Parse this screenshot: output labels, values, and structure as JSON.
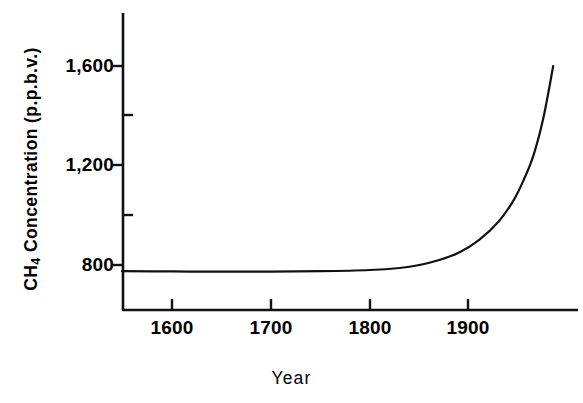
{
  "chart_data": {
    "type": "line",
    "title": "",
    "xlabel": "Year",
    "ylabel": "CH4 Concentration (p.p.b.v.)",
    "ylabel_prefix": "CH",
    "ylabel_subscript": "4",
    "ylabel_suffix": " Concentration (p.p.b.v.)",
    "xlim": [
      1550,
      2010
    ],
    "ylim": [
      600,
      1750
    ],
    "grid": false,
    "legend": null,
    "x_ticks": [
      1600,
      1700,
      1800,
      1900
    ],
    "x_tick_labels": [
      "1600",
      "1700",
      "1800",
      "1900"
    ],
    "y_ticks": [
      800,
      1000,
      1200,
      1400,
      1600
    ],
    "y_major_ticks": [
      800,
      1200,
      1600
    ],
    "y_minor_ticks": [
      1000,
      1400
    ],
    "y_tick_labels": [
      "800",
      "1,200",
      "1,600"
    ],
    "line_color": "#111111",
    "line_width": 2.2,
    "x": [
      1550,
      1600,
      1650,
      1700,
      1750,
      1800,
      1830,
      1850,
      1870,
      1890,
      1910,
      1930,
      1945,
      1955,
      1965,
      1975,
      1985
    ],
    "values": [
      775,
      774,
      773,
      773,
      775,
      780,
      788,
      800,
      820,
      850,
      900,
      975,
      1060,
      1140,
      1240,
      1390,
      1600
    ],
    "series": [
      {
        "name": "CH4 concentration",
        "values": [
          775,
          774,
          773,
          773,
          775,
          780,
          788,
          800,
          820,
          850,
          900,
          975,
          1060,
          1140,
          1240,
          1390,
          1600
        ]
      }
    ],
    "annotations": []
  },
  "axes": {
    "y_title": "CH4 Concentration (p.p.b.v.)",
    "x_title": "Year"
  },
  "caption": {
    "cropped_text": ""
  }
}
